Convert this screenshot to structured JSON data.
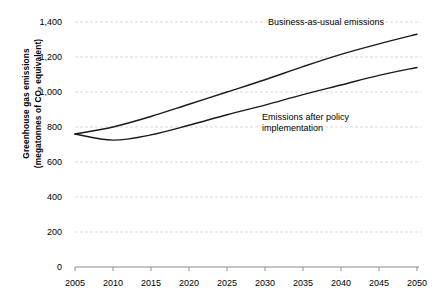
{
  "chart_data": {
    "type": "line",
    "title": "",
    "xlabel": "",
    "ylabel": "Greenhouse gas emissions\n(megatonnes of CO₂ equivalent)",
    "xlim": [
      2005,
      2050
    ],
    "ylim": [
      0,
      1400
    ],
    "grid": true,
    "legend_position": "inline-annotations",
    "xticks": [
      "2005",
      "2010",
      "2015",
      "2020",
      "2025",
      "2030",
      "2035",
      "2040",
      "2045",
      "2050"
    ],
    "yticks": [
      "0",
      "200",
      "400",
      "600",
      "800",
      "1,000",
      "1,200",
      "1,400"
    ],
    "x": [
      2005,
      2010,
      2015,
      2020,
      2025,
      2030,
      2035,
      2040,
      2045,
      2050
    ],
    "series": [
      {
        "name": "Business-as-usual emissions",
        "values": [
          760,
          800,
          860,
          930,
          1000,
          1070,
          1145,
          1215,
          1275,
          1330
        ]
      },
      {
        "name": "Emissions after policy implementation",
        "values": [
          760,
          725,
          755,
          810,
          870,
          925,
          985,
          1040,
          1095,
          1140
        ]
      }
    ],
    "annotations": [
      {
        "text": "Business-as-usual emissions",
        "series": "Business-as-usual emissions"
      },
      {
        "text": "Emissions after policy\nimplementation",
        "series": "Emissions after policy implementation"
      }
    ],
    "colors": {
      "line": "#1a1a1a",
      "grid": "#d9d9d9",
      "axis": "#808080",
      "background": "#ffffff",
      "text": "#000000"
    }
  }
}
